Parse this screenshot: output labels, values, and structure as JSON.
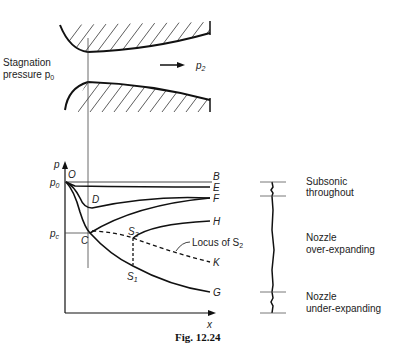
{
  "nozzle": {
    "stagnation_label_line1": "Stagnation",
    "stagnation_label_line2": "pressure p",
    "stagnation_sub": "0",
    "exit_pressure_label": "p",
    "exit_pressure_sub": "2"
  },
  "graph": {
    "y_axis_label": "p",
    "x_axis_label": "x",
    "origin_label": "O",
    "p0_label": "p",
    "p0_sub": "0",
    "pc_label": "p",
    "pc_sub": "c",
    "point_labels": {
      "B": "B",
      "E": "E",
      "F": "F",
      "H": "H",
      "K": "K",
      "G": "G",
      "D": "D",
      "C": "C",
      "S1": "S",
      "S1_sub": "1",
      "S2": "S",
      "S2_sub": "2"
    },
    "locus_label": "Locus of S",
    "locus_sub": "2"
  },
  "regimes": [
    {
      "line1": "Subsonic",
      "line2": "throughout"
    },
    {
      "line1": "Nozzle",
      "line2": "over-expanding"
    },
    {
      "line1": "Nozzle",
      "line2": "under-expanding"
    }
  ],
  "caption": "Fig. 12.24",
  "colors": {
    "ink": "#1a1a1a",
    "background": "#ffffff"
  }
}
